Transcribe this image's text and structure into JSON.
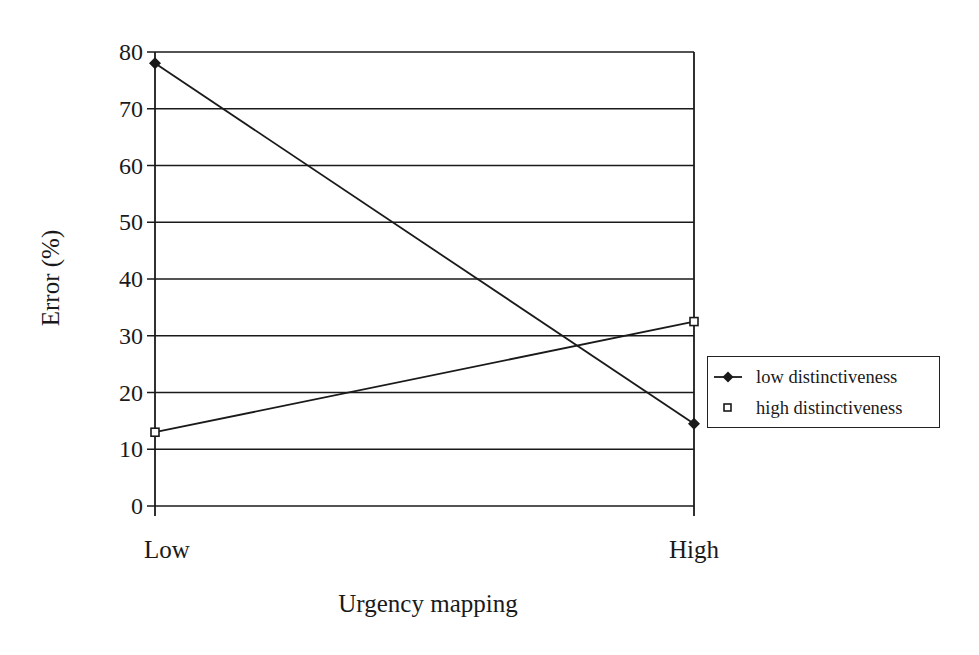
{
  "chart_data": {
    "type": "line",
    "title": "",
    "xlabel": "Urgency mapping",
    "ylabel": "Error (%)",
    "categories": [
      "Low",
      "High"
    ],
    "ylim": [
      0,
      80
    ],
    "yticks": [
      0,
      10,
      20,
      30,
      40,
      50,
      60,
      70,
      80
    ],
    "grid": "horizontal",
    "legend_position": "right",
    "series": [
      {
        "name": "low distinctiveness",
        "marker": "filled-diamond",
        "values": [
          78,
          14.5
        ]
      },
      {
        "name": "high distinctiveness",
        "marker": "open-square",
        "values": [
          13,
          32.5
        ]
      }
    ]
  },
  "axes": {
    "ytick_labels": [
      "0",
      "10",
      "20",
      "30",
      "40",
      "50",
      "60",
      "70",
      "80"
    ],
    "xtick_labels": [
      "Low",
      "High"
    ],
    "xlabel": "Urgency mapping",
    "ylabel": "Error (%)"
  },
  "legend": {
    "items": [
      {
        "label": "low distinctiveness",
        "icon": "filled-diamond-line"
      },
      {
        "label": "high distinctiveness",
        "icon": "open-square"
      }
    ]
  },
  "colors": {
    "line": "#1a1a1a",
    "grid": "#1a1a1a",
    "background": "#ffffff"
  }
}
